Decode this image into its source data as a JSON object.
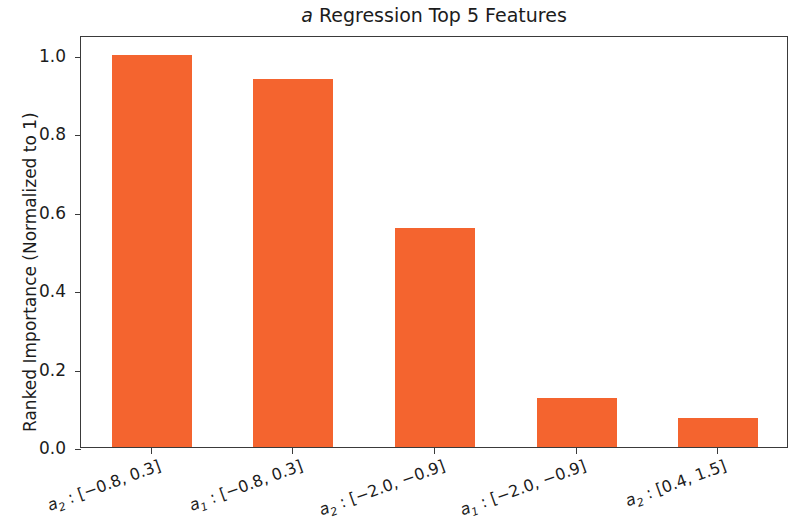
{
  "chart_data": {
    "type": "bar",
    "title": "a Regression Top 5 Features",
    "title_italic_prefix": "a",
    "title_rest": " Regression Top 5 Features",
    "xlabel": "",
    "ylabel": "Ranked Importance (Normalized to 1)",
    "ylim": [
      0.0,
      1.05
    ],
    "yticks": [
      "0.0",
      "0.2",
      "0.4",
      "0.6",
      "0.8",
      "1.0"
    ],
    "ytick_values": [
      0.0,
      0.2,
      0.4,
      0.6,
      0.8,
      1.0
    ],
    "grid": false,
    "legend": null,
    "bar_color": "#f4642f",
    "categories": [
      "a_2 : [-0.8, 0.3]",
      "a_1 : [-0.8, 0.3]",
      "a_2 : [-2.0, -0.9]",
      "a_1 : [-2.0, -0.9]",
      "a_2 : [0.4, 1.5]"
    ],
    "category_parts": [
      {
        "var": "a",
        "sub": "2",
        "range": " : [−0.8, 0.3]"
      },
      {
        "var": "a",
        "sub": "1",
        "range": " : [−0.8, 0.3]"
      },
      {
        "var": "a",
        "sub": "2",
        "range": " : [−2.0, −0.9]"
      },
      {
        "var": "a",
        "sub": "1",
        "range": " : [−2.0, −0.9]"
      },
      {
        "var": "a",
        "sub": "2",
        "range": " : [0.4, 1.5]"
      }
    ],
    "values": [
      1.0,
      0.939,
      0.557,
      0.125,
      0.074
    ]
  }
}
